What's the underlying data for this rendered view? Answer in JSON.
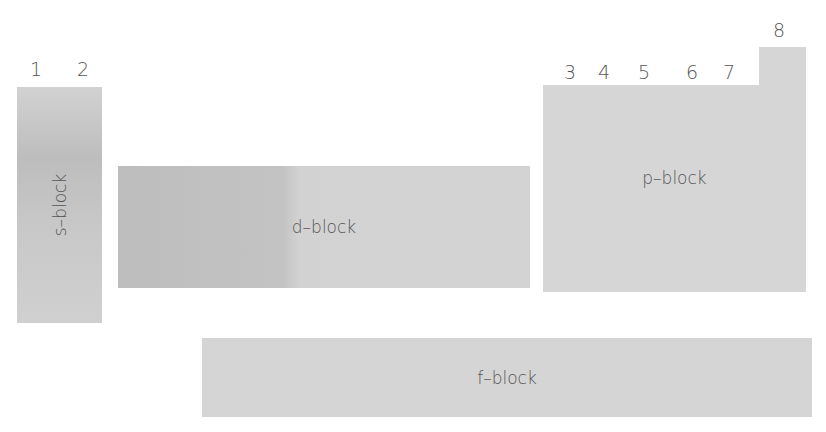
{
  "groups": [
    {
      "label": "1",
      "x": 30,
      "y": 60
    },
    {
      "label": "2",
      "x": 77,
      "y": 60
    },
    {
      "label": "3",
      "x": 564,
      "y": 63
    },
    {
      "label": "4",
      "x": 598,
      "y": 63
    },
    {
      "label": "5",
      "x": 638,
      "y": 63
    },
    {
      "label": "6",
      "x": 686,
      "y": 63
    },
    {
      "label": "7",
      "x": 723,
      "y": 63
    },
    {
      "label": "8",
      "x": 773,
      "y": 21
    }
  ],
  "blocks": {
    "s": {
      "label": "s–block"
    },
    "d": {
      "label": "d–block"
    },
    "p": {
      "label": "p–block"
    },
    "f": {
      "label": "f–block"
    }
  },
  "colors": {
    "block_fill": "#d3d3d3",
    "block_dark": "#bdbdbd",
    "text": "#555555",
    "background": "#ffffff"
  }
}
